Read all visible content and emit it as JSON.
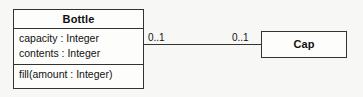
{
  "diagram": {
    "type": "uml-class-diagram",
    "background_color": "#f7f7f5",
    "line_color": "#333333",
    "classes": [
      {
        "id": "bottle",
        "name": "Bottle",
        "attributes": [
          "capacity : Integer",
          "contents : Integer"
        ],
        "operations": [
          "fill(amount : Integer)"
        ]
      },
      {
        "id": "cap",
        "name": "Cap",
        "attributes": [],
        "operations": []
      }
    ],
    "association": {
      "source": "Bottle",
      "target": "Cap",
      "source_multiplicity": "0..1",
      "target_multiplicity": "0..1",
      "style": "solid-line"
    }
  }
}
